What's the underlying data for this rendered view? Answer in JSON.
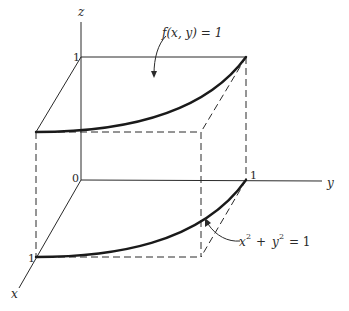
{
  "figure": {
    "type": "3d-region-diagram",
    "axes": {
      "x_label": "x",
      "y_label": "y",
      "z_label": "z",
      "origin_label": "0"
    },
    "ticks": {
      "z_one": "1",
      "x_one": "1",
      "y_one": "1"
    },
    "annotations": {
      "top_surface": "f(x, y) = 1",
      "base_curve_lhs_x": "x",
      "base_curve_exp1": "2",
      "base_curve_plus": "+",
      "base_curve_lhs_y": "y",
      "base_curve_exp2": "2",
      "base_curve_rhs": "= 1"
    },
    "colors": {
      "ink": "#2a2a2a",
      "background": "#ffffff"
    }
  }
}
